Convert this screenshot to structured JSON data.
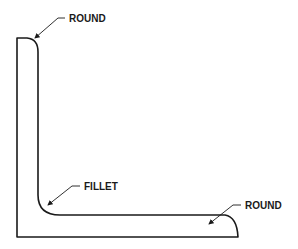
{
  "diagram": {
    "type": "angle-profile",
    "labels": {
      "round_top": "ROUND",
      "fillet": "FILLET",
      "round_right": "ROUND"
    },
    "colors": {
      "stroke": "#1a1a1a",
      "background": "#ffffff"
    }
  }
}
